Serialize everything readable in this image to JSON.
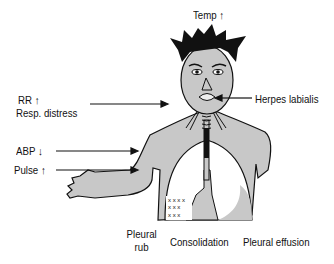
{
  "diagram": {
    "labels": {
      "temp": "Temp ↑",
      "rr": "RR ↑",
      "resp_distress": "Resp. distress",
      "herpes": "Herpes labialis",
      "abp": "ABP ↓",
      "pulse": "Pulse ↑",
      "pleural_rub_line1": "Pleural",
      "pleural_rub_line2": "rub",
      "consolidation": "Consolidation",
      "pleural_effusion": "Pleural effusion"
    },
    "colors": {
      "skin": "#c8c8c8",
      "hair": "#111111",
      "outline": "#111111",
      "lung_fill": "#ffffff",
      "consolidation_fill": "#c8c8c8",
      "effusion_fill": "#c8c8c8",
      "background": "#ffffff"
    }
  }
}
